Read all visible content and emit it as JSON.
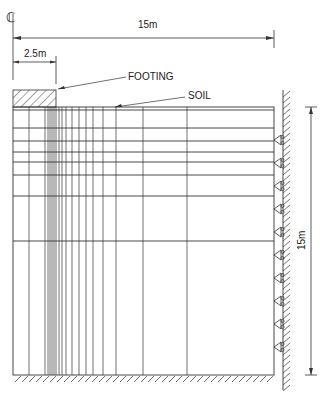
{
  "diagram": {
    "centerline_symbol": "CL",
    "dimensions": {
      "total_width": "15m",
      "footing_width": "2.5m",
      "depth": "15m"
    },
    "labels": {
      "footing": "FOOTING",
      "soil": "SOIL"
    },
    "mesh": {
      "vertical_lines_x": [
        29,
        45,
        48,
        50,
        52,
        54,
        56,
        59,
        62,
        66,
        72,
        79,
        86,
        93,
        103,
        116,
        143,
        187
      ],
      "horizontal_lines_y": [
        128,
        141,
        152,
        162,
        175,
        196,
        241
      ],
      "supports_y": [
        140,
        163,
        186,
        209,
        232,
        255,
        278,
        301,
        324,
        347
      ]
    },
    "colors": {
      "line": "#333333",
      "background": "#ffffff"
    }
  }
}
